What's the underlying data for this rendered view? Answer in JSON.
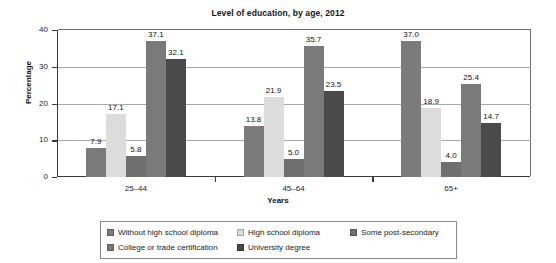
{
  "chart_data": {
    "type": "bar",
    "title": "Level of education, by age, 2012",
    "xlabel": "Years",
    "ylabel": "Percentage",
    "categories": [
      "25–44",
      "45–64",
      "65+"
    ],
    "ylim": [
      0,
      40
    ],
    "yticks": [
      0,
      10,
      20,
      30,
      40
    ],
    "ytick_labels": [
      "0",
      "10",
      "20",
      "30",
      "40"
    ],
    "grid": true,
    "legend_position": "bottom",
    "series": [
      {
        "name": "Without high school diploma",
        "color": "#7b7b7b",
        "values": [
          7.9,
          13.8,
          37.0
        ],
        "labels": [
          "7.9",
          "13.8",
          "37.0"
        ]
      },
      {
        "name": "High school diploma",
        "color": "#dcdcdc",
        "values": [
          17.1,
          21.9,
          18.9
        ],
        "labels": [
          "17.1",
          "21.9",
          "18.9"
        ]
      },
      {
        "name": "Some post-secondary",
        "color": "#6f6f6f",
        "values": [
          5.8,
          5.0,
          4.0
        ],
        "labels": [
          "5.8",
          "5.0",
          "4.0"
        ]
      },
      {
        "name": "College or trade certification",
        "color": "#7a7a7a",
        "values": [
          37.1,
          35.7,
          25.4
        ],
        "labels": [
          "37.1",
          "35.7",
          "25.4"
        ]
      },
      {
        "name": "University degree",
        "color": "#4a4a4a",
        "values": [
          32.1,
          23.5,
          14.7
        ],
        "labels": [
          "32.1",
          "23.5",
          "14.7"
        ]
      }
    ]
  },
  "legend": {
    "entries": [
      {
        "label": "Without high school diploma",
        "color": "#7b7b7b"
      },
      {
        "label": "High school diploma",
        "color": "#dcdcdc"
      },
      {
        "label": "Some post-secondary",
        "color": "#6f6f6f"
      },
      {
        "label": "College or trade certification",
        "color": "#7a7a7a"
      },
      {
        "label": "University degree",
        "color": "#4a4a4a"
      }
    ]
  }
}
